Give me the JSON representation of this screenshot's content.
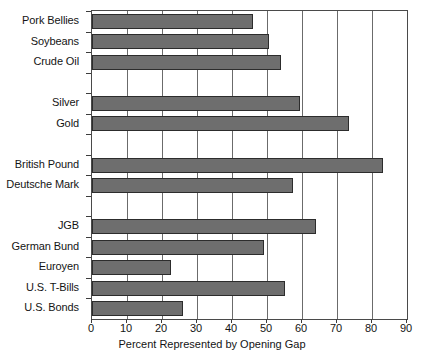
{
  "chart_data": {
    "type": "bar",
    "orientation": "horizontal",
    "title": "",
    "xlabel": "Percent Represented by Opening Gap",
    "ylabel": "",
    "xlim": [
      0,
      90
    ],
    "xticks": [
      0,
      10,
      20,
      30,
      40,
      50,
      60,
      70,
      80,
      90
    ],
    "xtick_labels": [
      "0",
      "10",
      "20",
      "30",
      "40",
      "50",
      "60",
      "70",
      "80",
      "90"
    ],
    "grid": "vertical",
    "legend": "none",
    "bar_color": "#6e6e6e",
    "bar_edge_color": "#2c2c2c",
    "categories": [
      "Pork Bellies",
      "Soybeans",
      "Crude Oil",
      "",
      "Silver",
      "Gold",
      "",
      "British Pound",
      "Deutsche Mark",
      "",
      "JGB",
      "German Bund",
      "Euroyen",
      "U.S. T-Bills",
      "U.S. Bonds"
    ],
    "values": [
      46,
      50.5,
      54,
      null,
      59.5,
      73.5,
      null,
      83,
      57.5,
      null,
      64,
      49,
      22.5,
      55,
      26
    ],
    "groups": [
      {
        "name": "Commodities",
        "categories": [
          "Pork Bellies",
          "Soybeans",
          "Crude Oil"
        ],
        "values": [
          46,
          50.5,
          54
        ]
      },
      {
        "name": "Metals",
        "categories": [
          "Silver",
          "Gold"
        ],
        "values": [
          59.5,
          73.5
        ]
      },
      {
        "name": "Currencies",
        "categories": [
          "British Pound",
          "Deutsche Mark"
        ],
        "values": [
          83,
          57.5
        ]
      },
      {
        "name": "Interest Rates",
        "categories": [
          "JGB",
          "German Bund",
          "Euroyen",
          "U.S. T-Bills",
          "U.S. Bonds"
        ],
        "values": [
          64,
          49,
          22.5,
          55,
          26
        ]
      }
    ]
  }
}
